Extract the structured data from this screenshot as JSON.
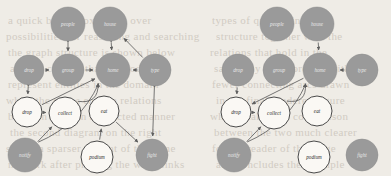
{
  "page": {
    "background_color": "#efece6",
    "node_gray_color": "#9a9a9a",
    "node_white_color": "#faf8f4",
    "edge_color": "#5f5f5f",
    "label_light_color": "#e9e9e9",
    "label_dark_color": "#2e2e2e"
  },
  "bleed_text": [
    {
      "text": "a  quick  brown  fox  jumps  over",
      "x": 8,
      "y": 14
    },
    {
      "text": "possibilities  for  reasoning  and  searching",
      "x": 6,
      "y": 30
    },
    {
      "text": "the  graph  structure  is  shown  below",
      "x": 8,
      "y": 46
    },
    {
      "text": "and  we  can  see  that  the  nodes",
      "x": 10,
      "y": 62
    },
    {
      "text": "represent  entities  in  the  domain",
      "x": 8,
      "y": 78
    },
    {
      "text": "while  the  edges  encode  relations",
      "x": 6,
      "y": 94
    },
    {
      "text": "between  them  in  a  directed  manner",
      "x": 8,
      "y": 110
    },
    {
      "text": "the  second  diagram  on  the  right",
      "x": 10,
      "y": 126
    },
    {
      "text": "shows  a  sparser  variant  of  the  same",
      "x": 6,
      "y": 142
    },
    {
      "text": "network  after  pruning  the  weak  links",
      "x": 8,
      "y": 158
    },
    {
      "text": "types  of  queries  in  graph",
      "x": 212,
      "y": 14
    },
    {
      "text": "structure  together  with  the",
      "x": 216,
      "y": 30
    },
    {
      "text": "relations  that  hold  in  the",
      "x": 210,
      "y": 46
    },
    {
      "text": "same  way  as  before  but  with",
      "x": 214,
      "y": 62
    },
    {
      "text": "fewer  connecting  arcs  drawn",
      "x": 212,
      "y": 78
    },
    {
      "text": "in  the  final  rendered  figure",
      "x": 216,
      "y": 94
    },
    {
      "text": "which  makes  the  comparison",
      "x": 210,
      "y": 110
    },
    {
      "text": "between  the  two  much  clearer",
      "x": 214,
      "y": 126
    },
    {
      "text": "for  the  reader  of  this  page",
      "x": 212,
      "y": 142
    },
    {
      "text": "and  concludes  the  example",
      "x": 216,
      "y": 158
    }
  ],
  "graphs": [
    {
      "id": "left-graph",
      "name": "dense-graph",
      "nodes": [
        {
          "id": "L_people",
          "label": "people",
          "x": 68,
          "y": 24,
          "r": 17,
          "type": "gray"
        },
        {
          "id": "L_house",
          "label": "house",
          "x": 110,
          "y": 24,
          "r": 17,
          "type": "gray"
        },
        {
          "id": "L_drop_e",
          "label": "drop",
          "x": 29,
          "y": 70,
          "r": 15,
          "type": "gray"
        },
        {
          "id": "L_group",
          "label": "group",
          "x": 68,
          "y": 70,
          "r": 16,
          "type": "gray"
        },
        {
          "id": "L_home",
          "label": "home",
          "x": 113,
          "y": 70,
          "r": 17,
          "type": "gray"
        },
        {
          "id": "L_type",
          "label": "type",
          "x": 155,
          "y": 70,
          "r": 16,
          "type": "gray"
        },
        {
          "id": "L_drop",
          "label": "drop",
          "x": 27,
          "y": 112,
          "r": 15,
          "type": "white"
        },
        {
          "id": "L_collect",
          "label": "collect",
          "x": 65,
          "y": 113,
          "r": 16,
          "type": "white"
        },
        {
          "id": "L_eat",
          "label": "eat",
          "x": 104,
          "y": 111,
          "r": 15,
          "type": "white"
        },
        {
          "id": "L_notify",
          "label": "notify",
          "x": 25,
          "y": 155,
          "r": 17,
          "type": "gray"
        },
        {
          "id": "L_podium",
          "label": "podium",
          "x": 97,
          "y": 157,
          "r": 16,
          "type": "white"
        },
        {
          "id": "L_fight",
          "label": "fight",
          "x": 152,
          "y": 155,
          "r": 16,
          "type": "gray"
        }
      ],
      "edges": [
        {
          "from": "L_people",
          "to": "L_group",
          "kind": "straight",
          "bidir": true
        },
        {
          "from": "L_house",
          "to": "L_home",
          "kind": "straight",
          "bidir": true
        },
        {
          "from": "L_drop_e",
          "to": "L_group",
          "kind": "straight",
          "bidir": false
        },
        {
          "from": "L_group",
          "to": "L_home",
          "kind": "straight",
          "bidir": false
        },
        {
          "from": "L_type",
          "to": "L_home",
          "kind": "straight",
          "bidir": false
        },
        {
          "from": "L_type",
          "to": "L_house",
          "kind": "straight",
          "bidir": false
        },
        {
          "from": "L_drop_e",
          "to": "L_drop",
          "kind": "straight",
          "bidir": true
        },
        {
          "from": "L_drop",
          "to": "L_collect",
          "kind": "straight",
          "bidir": false
        },
        {
          "from": "L_drop",
          "to": "L_home",
          "kind": "straight",
          "bidir": false
        },
        {
          "from": "L_collect",
          "to": "L_home",
          "kind": "curve",
          "bidir": false
        },
        {
          "from": "L_notify",
          "to": "L_collect",
          "kind": "straight",
          "bidir": false
        },
        {
          "from": "L_notify",
          "to": "L_home",
          "kind": "curve",
          "bidir": false
        },
        {
          "from": "L_eat",
          "to": "L_fight",
          "kind": "straight",
          "bidir": false
        },
        {
          "from": "L_podium",
          "to": "L_eat",
          "kind": "straight",
          "bidir": false
        },
        {
          "from": "L_type",
          "to": "L_fight",
          "kind": "straight",
          "bidir": true
        }
      ]
    },
    {
      "id": "right-graph",
      "name": "sparse-graph",
      "nodes": [
        {
          "id": "R_people",
          "label": "people",
          "x": 277,
          "y": 24,
          "r": 17,
          "type": "gray"
        },
        {
          "id": "R_house",
          "label": "house",
          "x": 317,
          "y": 24,
          "r": 17,
          "type": "gray"
        },
        {
          "id": "R_drop_e",
          "label": "drop",
          "x": 238,
          "y": 70,
          "r": 16,
          "type": "gray"
        },
        {
          "id": "R_group",
          "label": "group",
          "x": 279,
          "y": 70,
          "r": 16,
          "type": "gray"
        },
        {
          "id": "R_home",
          "label": "home",
          "x": 320,
          "y": 70,
          "r": 17,
          "type": "gray"
        },
        {
          "id": "R_type",
          "label": "type",
          "x": 362,
          "y": 70,
          "r": 16,
          "type": "gray"
        },
        {
          "id": "R_drop",
          "label": "drop",
          "x": 236,
          "y": 112,
          "r": 15,
          "type": "white"
        },
        {
          "id": "R_collect",
          "label": "collect",
          "x": 274,
          "y": 113,
          "r": 16,
          "type": "white"
        },
        {
          "id": "R_eat",
          "label": "eat",
          "x": 317,
          "y": 111,
          "r": 15,
          "type": "white"
        },
        {
          "id": "R_notify",
          "label": "notify",
          "x": 234,
          "y": 155,
          "r": 17,
          "type": "gray"
        },
        {
          "id": "R_podium",
          "label": "podium",
          "x": 314,
          "y": 157,
          "r": 16,
          "type": "white"
        },
        {
          "id": "R_fight",
          "label": "fight",
          "x": 362,
          "y": 155,
          "r": 16,
          "type": "gray"
        }
      ],
      "edges": [
        {
          "from": "R_house",
          "to": "R_home",
          "kind": "straight",
          "bidir": false
        },
        {
          "from": "R_type",
          "to": "R_home",
          "kind": "straight",
          "bidir": false
        },
        {
          "from": "R_drop_e",
          "to": "R_drop",
          "kind": "straight",
          "bidir": false
        },
        {
          "from": "R_drop",
          "to": "R_collect",
          "kind": "straight",
          "bidir": false
        },
        {
          "from": "R_home",
          "to": "R_drop",
          "kind": "straight",
          "bidir": false
        },
        {
          "from": "R_collect",
          "to": "R_home",
          "kind": "curve",
          "bidir": false
        },
        {
          "from": "R_notify",
          "to": "R_collect",
          "kind": "straight",
          "bidir": false
        },
        {
          "from": "R_notify",
          "to": "R_home",
          "kind": "curve",
          "bidir": false
        }
      ]
    }
  ]
}
